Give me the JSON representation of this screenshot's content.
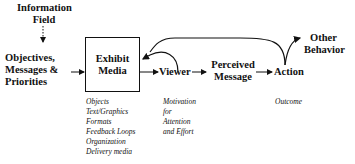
{
  "diagram": {
    "nodes": {
      "information_field": [
        "Information",
        "Field"
      ],
      "objectives": [
        "Objectives,",
        "Messages &",
        "Priorities"
      ],
      "exhibit_media": [
        "Exhibit",
        "Media"
      ],
      "viewer": "Viewer",
      "perceived_message": [
        "Perceived",
        "Message"
      ],
      "action": "Action",
      "other_behavior": [
        "Other",
        "Behavior"
      ]
    },
    "annotations": {
      "exhibit_media": [
        "Objects",
        "Text/Graphics",
        "Formats",
        "Feedback Loops",
        "Organization",
        "Delivery media"
      ],
      "viewer": [
        "Motivation",
        "for",
        "Attention",
        "and Effort"
      ],
      "action": [
        "Outcome"
      ]
    },
    "edges": [
      {
        "from": "information_field",
        "to": "objectives",
        "style": "dotted"
      },
      {
        "from": "objectives",
        "to": "exhibit_media",
        "style": "solid"
      },
      {
        "from": "exhibit_media",
        "to": "viewer",
        "style": "solid"
      },
      {
        "from": "viewer",
        "to": "perceived_message",
        "style": "solid"
      },
      {
        "from": "perceived_message",
        "to": "action",
        "style": "solid"
      },
      {
        "from": "action",
        "to": "exhibit_media",
        "style": "curved-feedback"
      },
      {
        "from": "action",
        "to": "other_behavior",
        "style": "curved"
      }
    ]
  }
}
